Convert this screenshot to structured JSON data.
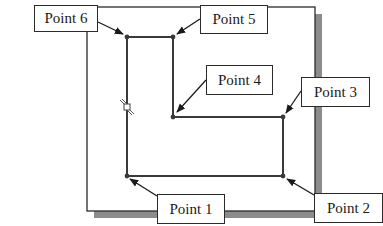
{
  "diagram": {
    "type": "sketch-profile-points",
    "colors": {
      "line": "#3a3a3a",
      "frame": "#2a2a2a",
      "shadow": "#8c8c8c",
      "vertex": "#3a3a3a",
      "background": "#ffffff"
    },
    "window_frame": {
      "x": 87,
      "y": 7,
      "width": 228,
      "height": 204,
      "shadow_offset": 7
    },
    "vertices": [
      {
        "id": "p1",
        "x": 127,
        "y": 176
      },
      {
        "id": "p2",
        "x": 283,
        "y": 176
      },
      {
        "id": "p3",
        "x": 283,
        "y": 117
      },
      {
        "id": "p4",
        "x": 173,
        "y": 117
      },
      {
        "id": "p5",
        "x": 173,
        "y": 37
      },
      {
        "id": "p6",
        "x": 127,
        "y": 37
      }
    ],
    "constraint_symbol": {
      "name": "vertical-constraint",
      "x": 127,
      "y": 107
    },
    "labels": [
      {
        "id": "p1",
        "text": "Point 1",
        "x": 157,
        "y": 194,
        "w": 68,
        "h": 30,
        "arrow_from": [
          157,
          196
        ],
        "arrow_to": [
          130,
          179
        ]
      },
      {
        "id": "p2",
        "text": "Point 2",
        "x": 314,
        "y": 193,
        "w": 69,
        "h": 30,
        "arrow_from": [
          314,
          195
        ],
        "arrow_to": [
          287,
          179
        ]
      },
      {
        "id": "p3",
        "text": "Point 3",
        "x": 301,
        "y": 77,
        "w": 69,
        "h": 30,
        "arrow_from": [
          301,
          91
        ],
        "arrow_to": [
          286,
          113
        ]
      },
      {
        "id": "p4",
        "text": "Point 4",
        "x": 206,
        "y": 65,
        "w": 67,
        "h": 30,
        "arrow_from": [
          206,
          80
        ],
        "arrow_to": [
          177,
          112
        ]
      },
      {
        "id": "p5",
        "text": "Point 5",
        "x": 200,
        "y": 5,
        "w": 68,
        "h": 29,
        "arrow_from": [
          200,
          19
        ],
        "arrow_to": [
          177,
          34
        ]
      },
      {
        "id": "p6",
        "text": "Point 6",
        "x": 34,
        "y": 5,
        "w": 64,
        "h": 27,
        "arrow_from": [
          98,
          22
        ],
        "arrow_to": [
          123,
          34
        ]
      }
    ]
  }
}
